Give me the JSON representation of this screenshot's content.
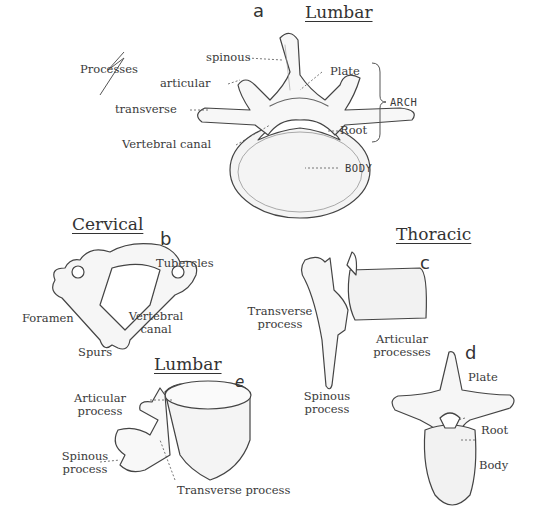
{
  "figure": {
    "panels": [
      {
        "letter": "a",
        "title": "Lumbar",
        "labels": {
          "processes": "Processes",
          "spinous": "spinous",
          "articular": "articular",
          "transverse": "transverse",
          "plate": "Plate",
          "root": "Root",
          "arch": "ARCH",
          "vertebral_canal": "Vertebral canal",
          "body": "BODY"
        }
      },
      {
        "letter": "b",
        "title": "Cervical",
        "labels": {
          "tubercles": "Tubercles",
          "foramen": "Foramen",
          "vertebral_canal_1": "Vertebral",
          "vertebral_canal_2": "canal",
          "spurs": "Spurs"
        }
      },
      {
        "letter": "c",
        "title": "Thoracic",
        "labels": {
          "transverse_1": "Transverse",
          "transverse_2": "process",
          "articular_1": "Articular",
          "articular_2": "processes",
          "spinous_1": "Spinous",
          "spinous_2": "process"
        }
      },
      {
        "letter": "d",
        "labels": {
          "plate": "Plate",
          "root": "Root",
          "body": "Body"
        }
      },
      {
        "letter": "e",
        "title": "Lumbar",
        "labels": {
          "articular_1": "Articular",
          "articular_2": "process",
          "spinous_1": "Spinous",
          "spinous_2": "process",
          "transverse": "Transverse process"
        }
      }
    ]
  }
}
